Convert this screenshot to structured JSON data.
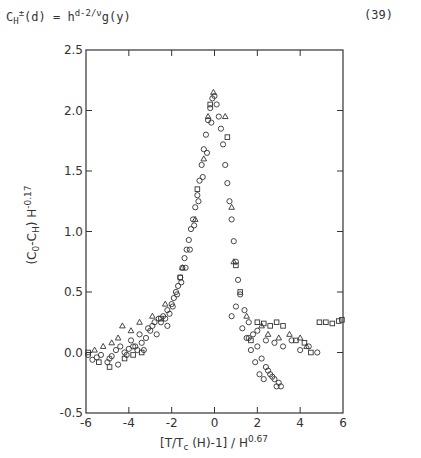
{
  "equation": {
    "header_fragment": "7012",
    "lhs_base": "C",
    "lhs_sub": "H",
    "lhs_sup": "±",
    "lhs_arg": "(d) = h",
    "rhs_sup": "d-2/ν",
    "rhs_tail": "g(y)",
    "number": "(39)"
  },
  "chart_data": {
    "type": "scatter",
    "title": "",
    "xlabel": "[T/T_c (H)-1]/H^0.67",
    "ylabel": "(C_0 - C_H) H^-0.17",
    "xlim": [
      -6,
      6
    ],
    "ylim": [
      -0.5,
      2.5
    ],
    "xticks": [
      -6,
      -4,
      -2,
      0,
      2,
      4,
      6
    ],
    "yticks": [
      -0.5,
      0.0,
      0.5,
      1.0,
      1.5,
      2.0,
      2.5
    ],
    "xtick_labels": [
      "-6",
      "-4",
      "-2",
      "0",
      "2",
      "4",
      "6"
    ],
    "ytick_labels": [
      "-0.5",
      "0.0",
      "0.5",
      "1.0",
      "1.5",
      "2.0",
      "2.5"
    ],
    "grid": false,
    "legend": null,
    "series": [
      {
        "name": "circles",
        "marker": "circle",
        "points": [
          [
            -5.9,
            -0.02
          ],
          [
            -5.7,
            -0.06
          ],
          [
            -5.5,
            -0.04
          ],
          [
            -5.3,
            -0.02
          ],
          [
            -5.0,
            -0.08
          ],
          [
            -4.8,
            -0.03
          ],
          [
            -4.6,
            0.02
          ],
          [
            -4.4,
            0.05
          ],
          [
            -4.2,
            0.0
          ],
          [
            -4.0,
            0.03
          ],
          [
            -3.8,
            0.05
          ],
          [
            -3.6,
            0.02
          ],
          [
            -3.4,
            0.08
          ],
          [
            -3.2,
            0.12
          ],
          [
            -3.0,
            0.18
          ],
          [
            -2.8,
            0.25
          ],
          [
            -2.6,
            0.28
          ],
          [
            -2.4,
            0.3
          ],
          [
            -2.2,
            0.35
          ],
          [
            -2.0,
            0.4
          ],
          [
            -1.9,
            0.45
          ],
          [
            -1.8,
            0.5
          ],
          [
            -1.7,
            0.55
          ],
          [
            -1.6,
            0.62
          ],
          [
            -1.5,
            0.7
          ],
          [
            -1.4,
            0.78
          ],
          [
            -1.3,
            0.85
          ],
          [
            -1.2,
            0.93
          ],
          [
            -1.1,
            1.02
          ],
          [
            -1.0,
            1.1
          ],
          [
            -0.9,
            1.2
          ],
          [
            -0.8,
            1.3
          ],
          [
            -0.7,
            1.42
          ],
          [
            -0.6,
            1.55
          ],
          [
            -0.5,
            1.68
          ],
          [
            -0.4,
            1.8
          ],
          [
            -0.3,
            1.92
          ],
          [
            -0.2,
            2.02
          ],
          [
            -0.1,
            2.1
          ],
          [
            0.0,
            2.12
          ],
          [
            -3.9,
            0.1
          ],
          [
            -3.5,
            0.15
          ],
          [
            -3.1,
            0.2
          ],
          [
            -2.9,
            0.22
          ],
          [
            -2.5,
            0.25
          ],
          [
            -2.3,
            0.28
          ],
          [
            -2.1,
            0.32
          ],
          [
            -1.75,
            0.48
          ],
          [
            -1.55,
            0.58
          ],
          [
            -1.35,
            0.7
          ],
          [
            -1.15,
            0.85
          ],
          [
            -0.95,
            1.05
          ],
          [
            -0.75,
            1.25
          ],
          [
            -0.55,
            1.45
          ],
          [
            -0.35,
            1.65
          ],
          [
            -0.15,
            1.9
          ],
          [
            -4.9,
            -0.05
          ],
          [
            -4.5,
            -0.1
          ],
          [
            -4.1,
            -0.02
          ],
          [
            -3.7,
            0.05
          ],
          [
            -3.3,
            0.02
          ],
          [
            -2.7,
            0.15
          ],
          [
            -2.2,
            0.22
          ],
          [
            -1.95,
            0.38
          ],
          [
            0.1,
            2.05
          ],
          [
            0.2,
            1.95
          ],
          [
            0.3,
            1.85
          ],
          [
            0.4,
            1.72
          ],
          [
            0.5,
            1.55
          ],
          [
            0.6,
            1.4
          ],
          [
            0.7,
            1.25
          ],
          [
            0.8,
            1.1
          ],
          [
            0.9,
            0.92
          ],
          [
            1.0,
            0.75
          ],
          [
            1.1,
            0.6
          ],
          [
            1.2,
            0.48
          ],
          [
            1.4,
            0.35
          ],
          [
            1.6,
            0.25
          ],
          [
            1.8,
            0.15
          ],
          [
            2.0,
            0.05
          ],
          [
            2.2,
            -0.05
          ],
          [
            2.4,
            -0.12
          ],
          [
            2.6,
            -0.18
          ],
          [
            2.8,
            -0.22
          ],
          [
            3.0,
            -0.25
          ],
          [
            0.8,
            0.3
          ],
          [
            1.0,
            0.38
          ],
          [
            1.3,
            0.2
          ],
          [
            1.5,
            0.12
          ],
          [
            1.7,
            0.02
          ],
          [
            1.9,
            -0.08
          ],
          [
            2.1,
            -0.18
          ],
          [
            2.3,
            -0.22
          ],
          [
            2.5,
            -0.15
          ],
          [
            2.7,
            -0.2
          ],
          [
            2.9,
            -0.28
          ],
          [
            3.1,
            -0.28
          ],
          [
            1.6,
            0.12
          ],
          [
            2.0,
            0.18
          ],
          [
            2.4,
            0.1
          ],
          [
            2.8,
            0.08
          ],
          [
            3.2,
            0.05
          ],
          [
            3.6,
            0.1
          ],
          [
            4.0,
            0.02
          ],
          [
            4.4,
            0.05
          ],
          [
            4.8,
            0.0
          ]
        ]
      },
      {
        "name": "triangles",
        "marker": "triangle",
        "points": [
          [
            -5.6,
            0.02
          ],
          [
            -5.2,
            0.05
          ],
          [
            -4.8,
            0.08
          ],
          [
            -4.5,
            0.12
          ],
          [
            -4.3,
            0.22
          ],
          [
            -3.9,
            0.18
          ],
          [
            -3.5,
            0.25
          ],
          [
            -2.9,
            0.3
          ],
          [
            -2.3,
            0.4
          ],
          [
            -1.5,
            0.7
          ],
          [
            -0.9,
            1.1
          ],
          [
            -0.5,
            1.6
          ],
          [
            -0.3,
            1.95
          ],
          [
            -0.05,
            2.15
          ],
          [
            0.5,
            1.95
          ],
          [
            0.8,
            1.2
          ],
          [
            0.9,
            0.75
          ],
          [
            1.5,
            0.3
          ],
          [
            2.2,
            0.22
          ],
          [
            2.5,
            0.15
          ],
          [
            3.0,
            0.12
          ],
          [
            3.5,
            0.15
          ],
          [
            4.0,
            0.12
          ],
          [
            4.3,
            0.05
          ]
        ]
      },
      {
        "name": "squares",
        "marker": "square",
        "points": [
          [
            -5.9,
            0.0
          ],
          [
            -5.4,
            -0.08
          ],
          [
            -4.9,
            -0.12
          ],
          [
            -4.2,
            -0.05
          ],
          [
            -3.8,
            -0.02
          ],
          [
            -3.4,
            0.0
          ],
          [
            -2.5,
            0.28
          ],
          [
            -1.6,
            0.62
          ],
          [
            -0.8,
            1.35
          ],
          [
            -0.2,
            2.05
          ],
          [
            0.6,
            1.78
          ],
          [
            1.0,
            0.72
          ],
          [
            1.2,
            0.5
          ],
          [
            1.7,
            0.1
          ],
          [
            2.0,
            0.25
          ],
          [
            2.3,
            0.24
          ],
          [
            2.6,
            0.22
          ],
          [
            2.9,
            0.25
          ],
          [
            3.2,
            0.22
          ],
          [
            3.8,
            0.1
          ],
          [
            4.2,
            0.08
          ],
          [
            4.5,
            0.0
          ],
          [
            4.9,
            0.25
          ],
          [
            5.2,
            0.25
          ],
          [
            5.5,
            0.24
          ],
          [
            5.8,
            0.26
          ],
          [
            5.95,
            0.27
          ]
        ]
      }
    ]
  }
}
